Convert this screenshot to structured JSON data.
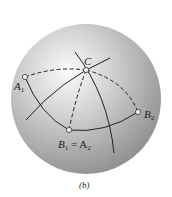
{
  "figure": {
    "caption": "(b)",
    "sphere": {
      "cx": 86,
      "cy": 99,
      "r": 75,
      "shade_light": "#f4f4f4",
      "shade_dark": "#8e8e8e"
    },
    "points": [
      {
        "id": "A1",
        "label": "A",
        "sub": "1",
        "x": 25,
        "y": 77
      },
      {
        "id": "C",
        "label": "C",
        "sub": "",
        "x": 86,
        "y": 70
      },
      {
        "id": "B2",
        "label": "B",
        "sub": "2",
        "x": 138,
        "y": 112
      },
      {
        "id": "B1A2",
        "label": "B",
        "sub": "1",
        "eq": "= A",
        "sub2": "2",
        "x": 69,
        "y": 130
      }
    ],
    "labels": {
      "A1": {
        "main": "A",
        "sub": "1"
      },
      "C": {
        "main": "C"
      },
      "B2": {
        "main": "B",
        "sub": "2"
      },
      "B1A2": {
        "main": "B",
        "sub": "1",
        "eq": " = A",
        "sub2": "2"
      }
    }
  }
}
